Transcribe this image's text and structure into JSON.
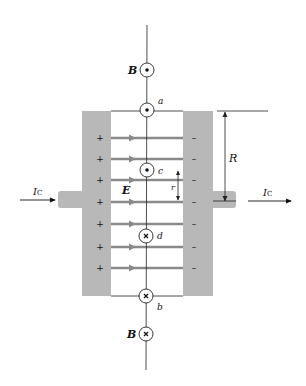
{
  "diagram": {
    "labels": {
      "B_top": "B",
      "B_bottom": "B",
      "point_a": "a",
      "point_b": "b",
      "point_c": "c",
      "point_d": "d",
      "E": "E",
      "R": "R",
      "r": "r",
      "current_left": "I",
      "current_left_sub": "C",
      "current_right": "I",
      "current_right_sub": "C",
      "plus": "+",
      "minus": "–"
    },
    "symbols": {
      "B_top": "out-of-page (dot)",
      "point_a": "out-of-page (dot)",
      "point_c": "out-of-page (dot)",
      "point_d": "into-page (cross)",
      "point_b": "into-page (cross)",
      "B_bottom": "into-page (cross)"
    },
    "field_lines": {
      "count": 7,
      "direction": "left-to-right"
    },
    "colors": {
      "plate": "#b8b8b8",
      "field_arrow": "#8a8a8a",
      "line": "#222222",
      "text": "#111111"
    }
  }
}
